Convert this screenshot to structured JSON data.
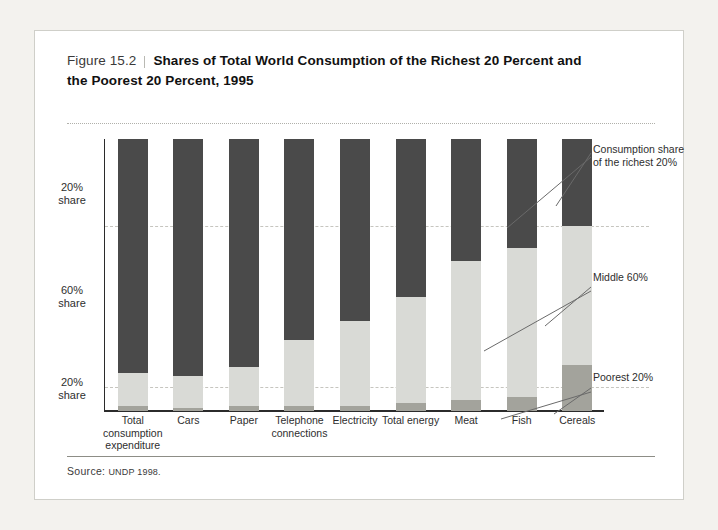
{
  "figure": {
    "number": "Figure 15.2",
    "title_line1": "Shares of Total World Consumption of the Richest 20 Percent and",
    "title_line2": "the Poorest 20 Percent, 1995",
    "source_label": "Source:",
    "source_value": "UNDP 1998."
  },
  "axis": {
    "y_ticks": [
      {
        "label_line1": "20%",
        "label_line2": "share"
      },
      {
        "label_line1": "60%",
        "label_line2": "share"
      },
      {
        "label_line1": "20%",
        "label_line2": "share"
      }
    ]
  },
  "annotations": {
    "richest": "Consumption share of the richest 20%",
    "middle": "Middle 60%",
    "poorest": "Poorest 20%"
  },
  "colors": {
    "richest": "#4a4a4a",
    "middle": "#d9dad6",
    "poorest": "#a3a39c",
    "card": "#ffffff",
    "page": "#f3f2ee",
    "axis": "#2b2b2b",
    "grid": "#c6c5bf"
  },
  "chart_data": {
    "type": "bar",
    "subtype": "stacked-100-percent",
    "title": "Shares of Total World Consumption of the Richest 20 Percent and the Poorest 20 Percent, 1995",
    "xlabel": "",
    "ylabel": "",
    "ylim": [
      0,
      100
    ],
    "grid": true,
    "gridlines": [
      20,
      80
    ],
    "legend_position": "right-annotations",
    "categories": [
      "Total consumption expenditure",
      "Cars",
      "Paper",
      "Telephone connections",
      "Electricity",
      "Total energy",
      "Meat",
      "Fish",
      "Cereals"
    ],
    "category_labels": [
      [
        "Total",
        "consumption",
        "expenditure"
      ],
      [
        "Cars"
      ],
      [
        "Paper"
      ],
      [
        "Telephone",
        "connections"
      ],
      [
        "Electricity"
      ],
      [
        "Total energy"
      ],
      [
        "Meat"
      ],
      [
        "Fish"
      ],
      [
        "Cereals"
      ]
    ],
    "series": [
      {
        "name": "Consumption share of the richest 20%",
        "color": "#4a4a4a",
        "values": [
          86,
          87,
          84,
          74,
          67,
          58,
          45,
          40,
          32
        ]
      },
      {
        "name": "Middle 60%",
        "color": "#d9dad6",
        "values": [
          12,
          12,
          14,
          24,
          31,
          39,
          51,
          55,
          51
        ]
      },
      {
        "name": "Poorest 20%",
        "color": "#a3a39c",
        "values": [
          2,
          1,
          2,
          2,
          2,
          3,
          4,
          5,
          17
        ]
      }
    ]
  }
}
